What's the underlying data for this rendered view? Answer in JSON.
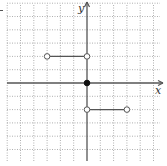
{
  "chart_data": {
    "type": "line",
    "title": "",
    "xlabel": "x",
    "ylabel": "y",
    "grid": true,
    "grid_style": "dotted",
    "xlim": [
      -6,
      5.5
    ],
    "ylim": [
      -6,
      6
    ],
    "tick_labels_shown": false,
    "series": [
      {
        "name": "segment-upper-left",
        "points": [
          [
            -3,
            2
          ],
          [
            0,
            2
          ]
        ],
        "endpoints": [
          "open",
          "open"
        ]
      },
      {
        "name": "point-origin",
        "points": [
          [
            0,
            0
          ]
        ],
        "endpoints": [
          "closed"
        ]
      },
      {
        "name": "segment-lower-right",
        "points": [
          [
            0,
            -2
          ],
          [
            3,
            -2
          ]
        ],
        "endpoints": [
          "open",
          "open"
        ]
      }
    ],
    "axis_labels": {
      "x": "x",
      "y": "y"
    },
    "colors": {
      "axis": "#555555",
      "grid": "#9a9a9a",
      "segment": "#555555",
      "point_fill_closed": "#111111",
      "point_fill_open": "#ffffff"
    }
  }
}
